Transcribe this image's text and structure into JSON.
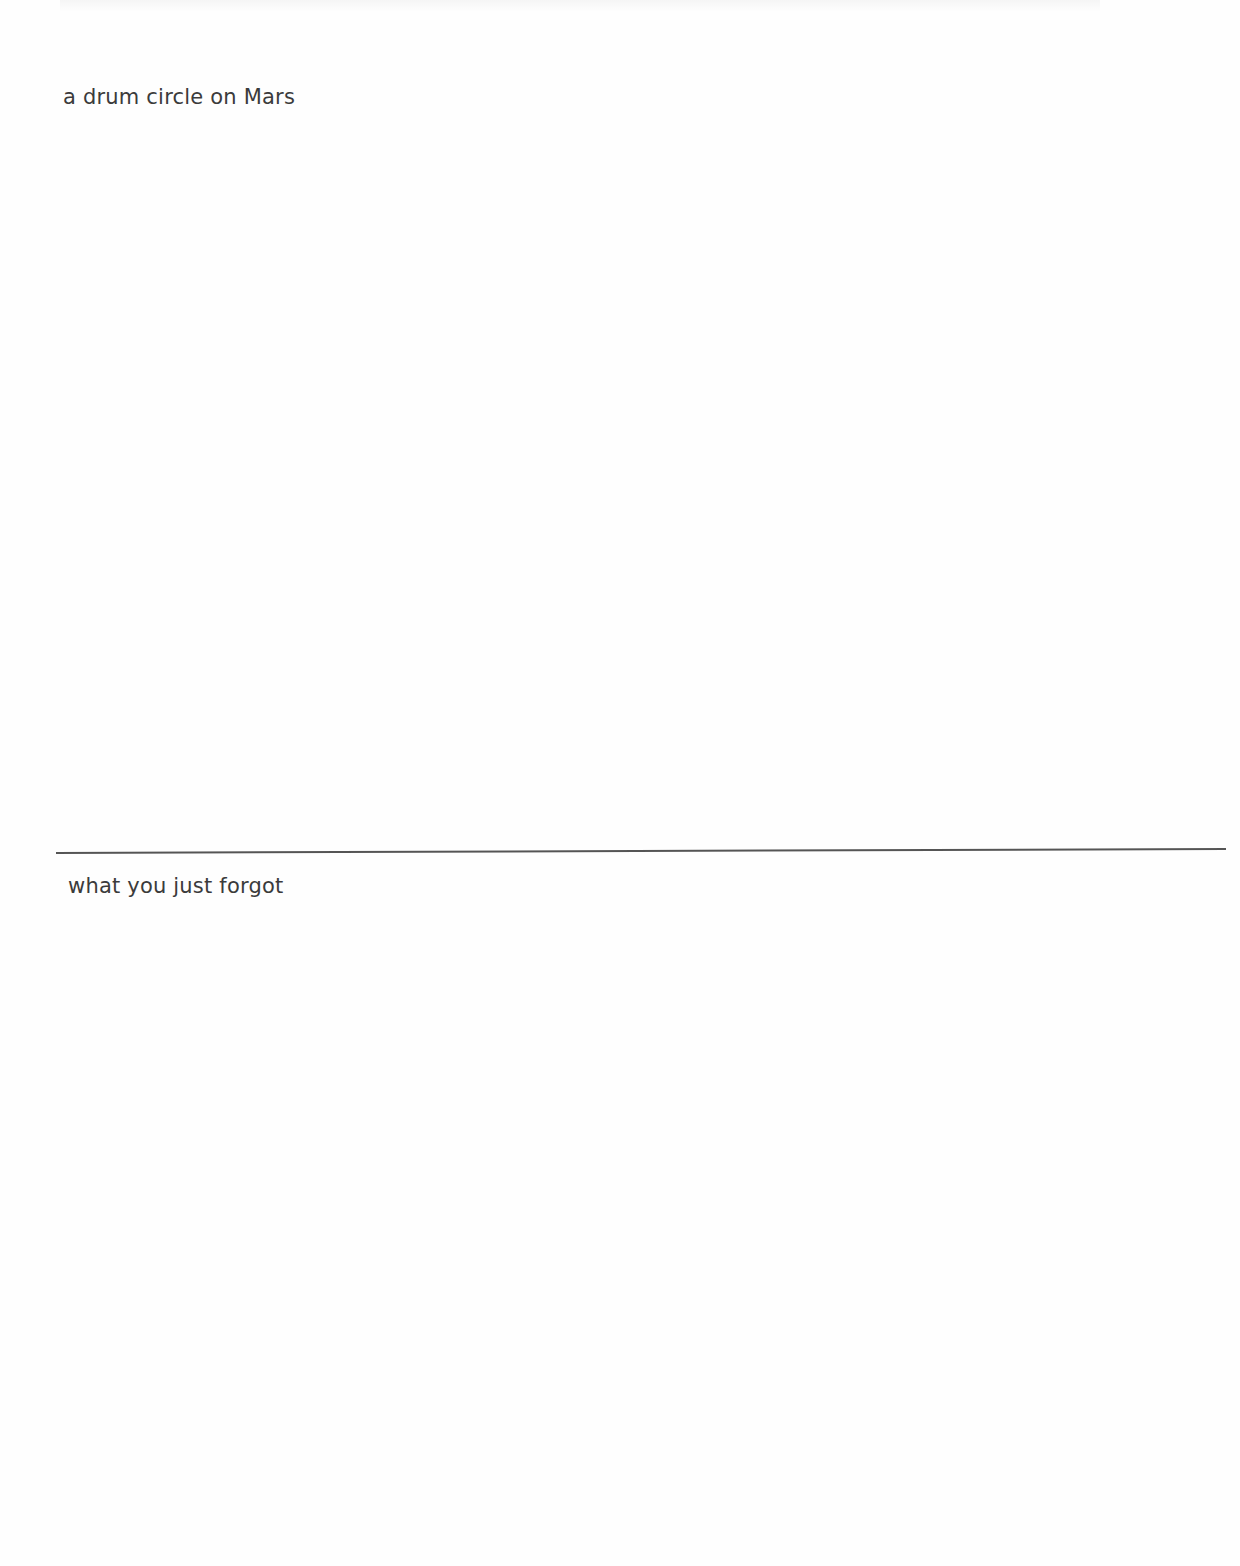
{
  "page": {
    "type": "drawing-prompt-worksheet",
    "background_color": "#fefefe",
    "text_color": "#3b3b3b",
    "divider_color": "#555555"
  },
  "sections": [
    {
      "prompt": "a drum circle on Mars"
    },
    {
      "prompt": "what you just forgot"
    }
  ]
}
